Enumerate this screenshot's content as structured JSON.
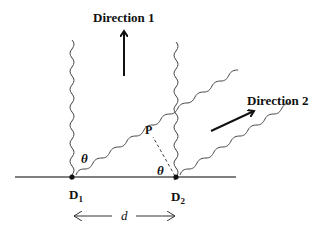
{
  "diagram": {
    "direction1_label": "Direction 1",
    "direction2_label": "Direction 2",
    "point_p_label": "P",
    "angle_label_1": "θ",
    "angle_label_2": "θ",
    "detector1": {
      "main": "D",
      "sub": "1"
    },
    "detector2": {
      "main": "D",
      "sub": "2"
    },
    "separation_label": "d",
    "colors": {
      "line": "#444444",
      "text": "#111111",
      "background": "#ffffff"
    }
  }
}
